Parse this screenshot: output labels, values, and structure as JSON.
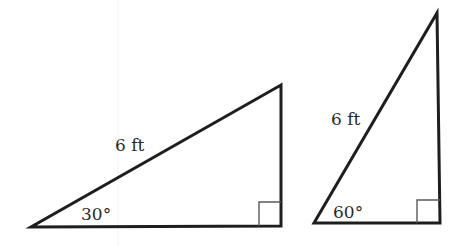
{
  "figure": {
    "triangles": [
      {
        "id": "left",
        "hypotenuse_label": "6 ft",
        "angle_label": "30°",
        "right_angle_marker": true,
        "vertices": [
          [
            31,
            227
          ],
          [
            281,
            226
          ],
          [
            281,
            85
          ]
        ]
      },
      {
        "id": "right",
        "hypotenuse_label": "6 ft",
        "angle_label": "60°",
        "right_angle_marker": true,
        "vertices": [
          [
            314,
            223
          ],
          [
            440,
            223
          ],
          [
            437,
            13
          ]
        ]
      }
    ],
    "colors": {
      "stroke": "#1e1e1e",
      "marker": "#5a5a5a",
      "text": "#2a2a2a",
      "background": "#ffffff"
    }
  }
}
